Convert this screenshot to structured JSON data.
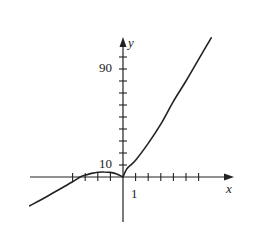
{
  "chart_data": {
    "type": "line",
    "title": "",
    "xlabel": "x",
    "ylabel": "y",
    "x_tick_label": "1",
    "y_tick_labels": [
      "10",
      "90"
    ],
    "x_ticks": [
      -4,
      -3,
      -2,
      -1,
      1,
      2,
      3,
      4,
      5,
      6
    ],
    "y_ticks": [
      10,
      20,
      30,
      40,
      50,
      60,
      70,
      80,
      90,
      100
    ],
    "xlim": [
      -7.4,
      8.8
    ],
    "ylim": [
      -37,
      115
    ],
    "grid": false,
    "legend": null,
    "annotations": [
      "cusp at origin (0,0)",
      "x-intercept near x = -3",
      "local max near x = -1.5, y ≈ 4"
    ],
    "series": [
      {
        "name": "y = f(x)",
        "color": "#222222",
        "x": [
          -7.4,
          -6,
          -5,
          -4,
          -3.4,
          -3,
          -2.5,
          -2,
          -1.5,
          -1,
          -0.5,
          0,
          0.25,
          0.5,
          1,
          2,
          3,
          4,
          5,
          6,
          7
        ],
        "y": [
          -24,
          -16,
          -10,
          -4,
          0,
          1.5,
          3,
          4,
          4.2,
          3.8,
          2.5,
          0,
          6,
          9,
          14,
          28,
          44,
          63,
          80,
          98,
          116
        ]
      }
    ]
  },
  "axes": {
    "x_label": "x",
    "y_label": "y",
    "x_tick_1": "1",
    "y_tick_10": "10",
    "y_tick_90": "90"
  }
}
